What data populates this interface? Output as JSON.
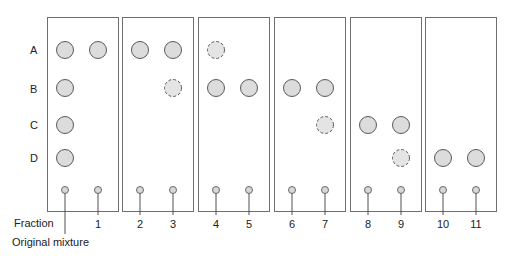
{
  "diagram": {
    "title": "",
    "row_labels": [
      "A",
      "B",
      "C",
      "D"
    ],
    "fraction_label": "Fraction",
    "original_mixture_label": "Original mixture",
    "lanes": [
      {
        "label": "",
        "name": "original-mixture",
        "spots": [
          {
            "row": "A",
            "style": "solid"
          },
          {
            "row": "B",
            "style": "solid"
          },
          {
            "row": "C",
            "style": "solid"
          },
          {
            "row": "D",
            "style": "solid"
          }
        ]
      },
      {
        "label": "1",
        "spots": [
          {
            "row": "A",
            "style": "solid"
          }
        ]
      },
      {
        "label": "2",
        "spots": [
          {
            "row": "A",
            "style": "solid"
          }
        ]
      },
      {
        "label": "3",
        "spots": [
          {
            "row": "A",
            "style": "solid"
          },
          {
            "row": "B",
            "style": "faint"
          }
        ]
      },
      {
        "label": "4",
        "spots": [
          {
            "row": "A",
            "style": "faint"
          },
          {
            "row": "B",
            "style": "solid"
          }
        ]
      },
      {
        "label": "5",
        "spots": [
          {
            "row": "B",
            "style": "solid"
          }
        ]
      },
      {
        "label": "6",
        "spots": [
          {
            "row": "B",
            "style": "solid"
          }
        ]
      },
      {
        "label": "7",
        "spots": [
          {
            "row": "B",
            "style": "solid"
          },
          {
            "row": "C",
            "style": "faint"
          }
        ]
      },
      {
        "label": "8",
        "spots": [
          {
            "row": "C",
            "style": "solid"
          }
        ]
      },
      {
        "label": "9",
        "spots": [
          {
            "row": "C",
            "style": "solid"
          },
          {
            "row": "D",
            "style": "faint"
          }
        ]
      },
      {
        "label": "10",
        "spots": [
          {
            "row": "D",
            "style": "solid"
          }
        ]
      },
      {
        "label": "11",
        "spots": [
          {
            "row": "D",
            "style": "solid"
          }
        ]
      }
    ],
    "plates": 6,
    "lanes_per_plate": 2
  }
}
